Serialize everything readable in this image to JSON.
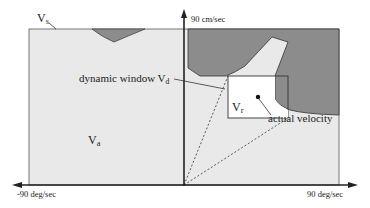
{
  "figure": {
    "labels": {
      "vs_main": "V",
      "vs_sub": "s",
      "va_main": "V",
      "va_sub": "a",
      "vr_main": "V",
      "vr_sub": "r",
      "dynamic_window_main": "dynamic window V",
      "dynamic_window_sub": "d",
      "actual_velocity": "actual velocity"
    },
    "axes": {
      "y_top": "90 cm/sec",
      "x_left": "-90 deg/sec",
      "x_right": "90 deg/sec"
    },
    "colors": {
      "admissible_region": "#e9e9e9",
      "obstacle_region": "#8c8c8c",
      "dynamic_window": "#ffffff",
      "lines": "#333333"
    }
  }
}
